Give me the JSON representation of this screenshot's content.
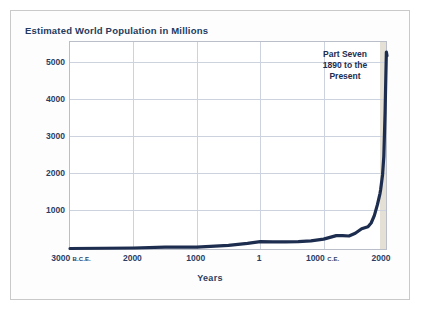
{
  "figure": {
    "title": "Estimated World Population in Millions",
    "annotation_lines": [
      "Part Seven",
      "1890 to the",
      "Present"
    ],
    "colors": {
      "curve": "#1d2d4f",
      "grid": "#ccd2de",
      "axis": "#b9bec8",
      "shade": "#e4e0d5",
      "text": "#2b3d63",
      "border": "#c9c9c9"
    }
  },
  "chart_data": {
    "type": "line",
    "title": "Estimated World Population in Millions",
    "xlabel": "Years",
    "ylabel": "",
    "ylim": [
      0,
      5600
    ],
    "xlim": [
      -3000,
      2000
    ],
    "grid": true,
    "legend": "none",
    "ytick_labels": [
      "5000",
      "4000",
      "3000",
      "2000",
      "1000"
    ],
    "ytick_values": [
      5000,
      4000,
      3000,
      2000,
      1000
    ],
    "xtick_labels": [
      "3000 B.C.E.",
      "2000",
      "1000",
      "1",
      "1000 C.E.",
      "2000"
    ],
    "xtick_main": [
      "3000",
      "2000",
      "1000",
      "1",
      "1000",
      "2000"
    ],
    "xtick_era": [
      "B.C.E.",
      "",
      "",
      "",
      "C.E.",
      ""
    ],
    "xtick_values": [
      -3000,
      -2000,
      -1000,
      1,
      1000,
      2000
    ],
    "annotations": [
      {
        "text": "Part Seven 1890 to the Present",
        "type": "shaded-band",
        "x_start": 1890,
        "x_end": 2000
      }
    ],
    "series": [
      {
        "name": "World population (millions)",
        "x": [
          -3000,
          -2500,
          -2000,
          -1500,
          -1000,
          -500,
          -200,
          1,
          200,
          400,
          600,
          800,
          1000,
          1200,
          1300,
          1400,
          1500,
          1600,
          1700,
          1750,
          1800,
          1850,
          1890,
          1900,
          1930,
          1950,
          1970,
          1990,
          2000
        ],
        "values": [
          14,
          20,
          27,
          50,
          50,
          100,
          150,
          200,
          190,
          190,
          200,
          220,
          265,
          360,
          360,
          350,
          425,
          545,
          600,
          700,
          900,
          1200,
          1500,
          1600,
          2000,
          2500,
          3700,
          5300,
          5200
        ]
      }
    ]
  }
}
